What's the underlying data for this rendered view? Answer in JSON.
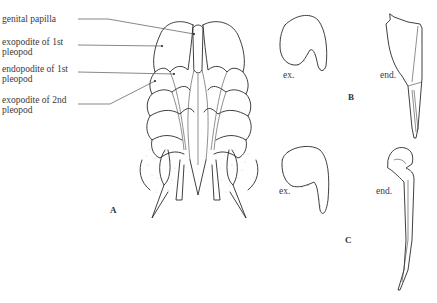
{
  "figure": {
    "panels": [
      {
        "id": "A",
        "letter": "A",
        "description": "ventral view of pleopods",
        "callouts": [
          {
            "text": "genital papilla"
          },
          {
            "text": "exopodite of 1st pleopod"
          },
          {
            "text": "endopodite of 1st pleopod"
          },
          {
            "text": "exopodite of 2nd pleopod"
          }
        ]
      },
      {
        "id": "B",
        "letter": "B",
        "parts": [
          {
            "label": "ex."
          },
          {
            "label": "end."
          }
        ]
      },
      {
        "id": "C",
        "letter": "C",
        "parts": [
          {
            "label": "ex."
          },
          {
            "label": "end."
          }
        ]
      }
    ]
  }
}
